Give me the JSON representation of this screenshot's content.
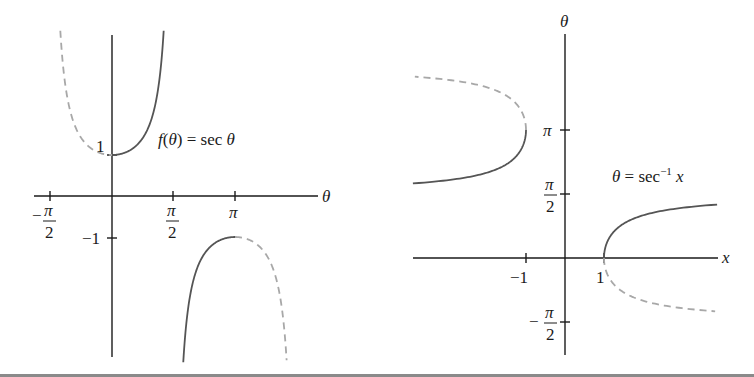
{
  "left_graph": {
    "title": "f(θ) = sec θ",
    "function_label": {
      "italic_f": "f",
      "open": "(",
      "var": "θ",
      "close": ")",
      "eq": " = sec ",
      "var2": "θ"
    },
    "x_axis_label": "θ",
    "x_ticks": [
      {
        "label_sign": "−",
        "label_num": "π",
        "label_den": "2",
        "value": -1.5708
      },
      {
        "label_sign": "",
        "label_num": "π",
        "label_den": "2",
        "value": 1.5708
      },
      {
        "label": "π",
        "value": 3.1416
      }
    ],
    "y_ticks": [
      {
        "label": "1",
        "value": 1
      },
      {
        "label": "−1",
        "value": -1
      }
    ],
    "colors": {
      "axis": "#1a1a1a",
      "solid_curve": "#555555",
      "dashed_curve": "#a8a8a8"
    }
  },
  "right_graph": {
    "title": "θ = sec⁻¹ x",
    "function_label": {
      "var": "θ",
      "eq": " = sec",
      "sup": "−1",
      "arg": "x"
    },
    "x_axis_label": "x",
    "y_axis_label": "θ",
    "x_ticks": [
      {
        "label": "−1",
        "value": -1
      },
      {
        "label": "1",
        "value": 1
      }
    ],
    "y_ticks": [
      {
        "label": "π",
        "value": 3.1416
      },
      {
        "label_sign": "",
        "label_num": "π",
        "label_den": "2",
        "value": 1.5708
      },
      {
        "label_sign": "−",
        "label_num": "π",
        "label_den": "2",
        "value": -1.5708
      }
    ]
  },
  "chart_data": [
    {
      "type": "line",
      "title": "f(θ) = sec θ",
      "xlabel": "θ",
      "ylabel": "",
      "xlim": [
        -2.0,
        5.3
      ],
      "ylim": [
        -3.9,
        3.9
      ],
      "grid": false,
      "series": [
        {
          "name": "sec θ on [0, π/2) (solid, principal branch)",
          "style": "solid",
          "x_range": [
            0,
            1.32
          ],
          "points": [
            [
              0,
              1
            ],
            [
              0.5,
              1.14
            ],
            [
              1.0,
              1.85
            ],
            [
              1.2,
              2.76
            ],
            [
              1.32,
              4.0
            ]
          ]
        },
        {
          "name": "sec θ on (−π/2, 0] (dashed)",
          "style": "dashed",
          "x_range": [
            -1.32,
            0
          ],
          "points": [
            [
              -1.32,
              4.0
            ],
            [
              -1.0,
              1.85
            ],
            [
              -0.5,
              1.14
            ],
            [
              0,
              1
            ]
          ]
        },
        {
          "name": "sec θ on (π/2, π] (solid, principal branch)",
          "style": "solid",
          "x_range": [
            1.82,
            3.1416
          ],
          "points": [
            [
              1.82,
              -4.0
            ],
            [
              2.0,
              -2.4
            ],
            [
              2.5,
              -1.25
            ],
            [
              3.1416,
              -1
            ]
          ]
        },
        {
          "name": "sec θ on [π, 3π/2) (dashed)",
          "style": "dashed",
          "x_range": [
            3.1416,
            4.46
          ],
          "points": [
            [
              3.1416,
              -1
            ],
            [
              3.8,
              -1.27
            ],
            [
              4.3,
              -2.5
            ],
            [
              4.46,
              -4.0
            ]
          ]
        }
      ],
      "annotations": [
        "1",
        "−1",
        "−π/2",
        "π/2",
        "π"
      ]
    },
    {
      "type": "line",
      "title": "θ = sec⁻¹ x",
      "xlabel": "x",
      "ylabel": "θ",
      "xlim": [
        -3.9,
        3.9
      ],
      "ylim": [
        -2.3,
        5.5
      ],
      "grid": false,
      "series": [
        {
          "name": "sec⁻¹ x for x ≥ 1 (solid)",
          "style": "solid",
          "x_range": [
            1,
            3.9
          ],
          "points": [
            [
              1,
              0
            ],
            [
              1.5,
              0.841
            ],
            [
              2,
              1.047
            ],
            [
              3,
              1.231
            ],
            [
              3.9,
              1.314
            ]
          ]
        },
        {
          "name": "sec⁻¹ x for x ≤ −1 (solid)",
          "style": "solid",
          "x_range": [
            -3.9,
            -1
          ],
          "points": [
            [
              -3.9,
              1.828
            ],
            [
              -3,
              1.911
            ],
            [
              -2,
              2.094
            ],
            [
              -1.5,
              2.301
            ],
            [
              -1,
              3.1416
            ]
          ]
        },
        {
          "name": "reflected branch x ≥ 1 (dashed)",
          "style": "dashed",
          "x_range": [
            1,
            3.85
          ],
          "points": [
            [
              1,
              0
            ],
            [
              1.5,
              -0.841
            ],
            [
              2,
              -1.047
            ],
            [
              3.85,
              -1.31
            ]
          ]
        },
        {
          "name": "reflected branch x ≤ −1 (dashed)",
          "style": "dashed",
          "x_range": [
            -3.85,
            -1
          ],
          "points": [
            [
              -1,
              3.1416
            ],
            [
              -1.5,
              3.982
            ],
            [
              -2,
              4.189
            ],
            [
              -3.85,
              4.45
            ]
          ]
        }
      ],
      "annotations": [
        "−1",
        "1",
        "π",
        "π/2",
        "−π/2"
      ]
    }
  ]
}
